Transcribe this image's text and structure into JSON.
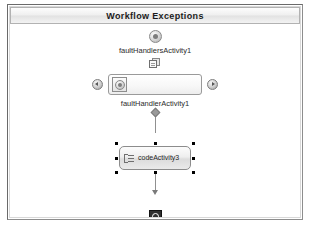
{
  "window": {
    "title": "Workflow Exceptions"
  },
  "canvas": {
    "start_icon": "exception-start-icon",
    "fault_handlers": {
      "label": "faultHandlersActivity1",
      "pages_icon": "pages-icon",
      "nav_prev_icon": "chevron-left-icon",
      "nav_next_icon": "chevron-right-icon",
      "selected_tile_icon": "fault-handler-tile-icon"
    },
    "fault_handler": {
      "label": "faultHandlerActivity1",
      "connector_icon": "diamond-connector-icon"
    },
    "code_activity": {
      "label": "codeActivity3",
      "icon": "code-activity-icon",
      "selected": true
    },
    "terminator": {
      "icon": "workflow-terminator-icon"
    }
  },
  "colors": {
    "frame_border": "#6a6a6a",
    "title_text": "#1c1c1c",
    "connector": "#909090",
    "selection_handle": "#000000",
    "terminator_fill": "#2e2e2e"
  }
}
